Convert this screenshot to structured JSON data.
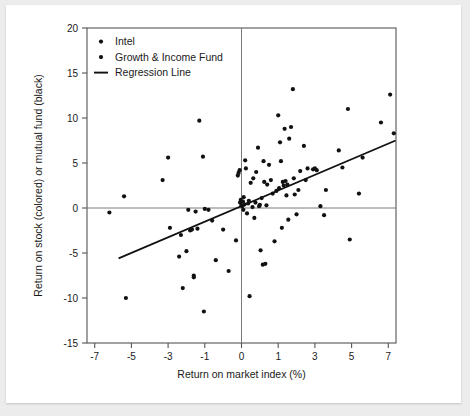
{
  "chart_data": {
    "type": "scatter",
    "title": "",
    "xlabel": "Return on market index (%)",
    "ylabel": "Return on stock (colored) or mutual fund (black)",
    "xlim": [
      -7.6,
      7.9
    ],
    "ylim": [
      -15,
      20
    ],
    "xticks": [
      "-7",
      "-5",
      "-3",
      "-1",
      "0",
      "1",
      "3",
      "5",
      "7"
    ],
    "xtick_values": [
      -7,
      -5,
      -3,
      -1,
      0,
      1,
      3,
      5,
      7
    ],
    "yticks": [
      "20",
      "15",
      "10",
      "5",
      "0",
      "-5",
      "-10",
      "-15"
    ],
    "ytick_values": [
      20,
      15,
      10,
      5,
      0,
      -5,
      -10,
      -15
    ],
    "grid": false,
    "reference_lines": [
      {
        "name": "zero-horizontal",
        "axis": "y",
        "value": 0,
        "color": "#7a7a7a"
      },
      {
        "name": "zero-vertical",
        "axis": "x",
        "value": 0,
        "color": "#7a7a7a"
      }
    ],
    "legend": {
      "position": "top-left",
      "entries": [
        {
          "label": "Intel",
          "marker": "dot",
          "color": "#111111"
        },
        {
          "label": "Growth & Income Fund",
          "marker": "dot",
          "color": "#111111"
        },
        {
          "label": "Regression Line",
          "marker": "line",
          "color": "#111111"
        }
      ]
    },
    "series": [
      {
        "name": "Growth & Income Fund",
        "marker": "dot",
        "color": "#111111",
        "points": [
          [
            -5.4,
            1.3
          ],
          [
            -5.3,
            -10.0
          ],
          [
            -6.2,
            -0.5
          ],
          [
            -3.3,
            3.1
          ],
          [
            -3.0,
            5.6
          ],
          [
            -2.9,
            -2.2
          ],
          [
            -2.4,
            -5.4
          ],
          [
            -2.3,
            -3.0
          ],
          [
            -2.2,
            -8.9
          ],
          [
            -2.0,
            -4.8
          ],
          [
            -1.9,
            -0.2
          ],
          [
            -1.8,
            -2.5
          ],
          [
            -1.7,
            -2.4
          ],
          [
            -1.6,
            -7.5
          ],
          [
            -1.6,
            -7.7
          ],
          [
            -1.5,
            -0.4
          ],
          [
            -1.4,
            -2.3
          ],
          [
            -1.3,
            9.7
          ],
          [
            -1.1,
            5.7
          ],
          [
            -1.05,
            -11.5
          ],
          [
            -1.0,
            -0.1
          ],
          [
            -0.9,
            -0.2
          ],
          [
            -0.8,
            -1.4
          ],
          [
            -0.7,
            -5.8
          ],
          [
            -0.5,
            -2.4
          ],
          [
            -0.35,
            -7.0
          ],
          [
            -0.15,
            -3.6
          ],
          [
            -0.1,
            3.6
          ],
          [
            -0.08,
            3.9
          ],
          [
            -0.05,
            4.2
          ],
          [
            -0.04,
            0.6
          ],
          [
            -0.02,
            0.9
          ],
          [
            0.0,
            0.3
          ],
          [
            0.02,
            0.2
          ],
          [
            0.04,
            0.7
          ],
          [
            0.05,
            -0.2
          ],
          [
            0.06,
            1.2
          ],
          [
            0.08,
            0.4
          ],
          [
            0.1,
            5.3
          ],
          [
            0.12,
            4.4
          ],
          [
            0.15,
            -0.6
          ],
          [
            0.18,
            0.5
          ],
          [
            0.2,
            0.8
          ],
          [
            0.22,
            -9.8
          ],
          [
            0.25,
            2.8
          ],
          [
            0.3,
            0.1
          ],
          [
            0.32,
            3.3
          ],
          [
            0.35,
            -1.1
          ],
          [
            0.38,
            0.6
          ],
          [
            0.4,
            4.0
          ],
          [
            0.45,
            6.7
          ],
          [
            0.48,
            0.2
          ],
          [
            0.5,
            0.35
          ],
          [
            0.52,
            -4.7
          ],
          [
            0.55,
            1.1
          ],
          [
            0.58,
            -6.3
          ],
          [
            0.6,
            5.2
          ],
          [
            0.62,
            2.9
          ],
          [
            0.65,
            -6.2
          ],
          [
            0.68,
            0.3
          ],
          [
            0.7,
            2.6
          ],
          [
            0.75,
            4.8
          ],
          [
            0.8,
            3.1
          ],
          [
            0.85,
            1.6
          ],
          [
            0.9,
            -3.7
          ],
          [
            0.95,
            1.9
          ],
          [
            1.0,
            10.3
          ],
          [
            1.05,
            2.2
          ],
          [
            1.1,
            7.3
          ],
          [
            1.15,
            5.2
          ],
          [
            1.2,
            -2.2
          ],
          [
            1.25,
            2.9
          ],
          [
            1.3,
            2.5
          ],
          [
            1.35,
            8.8
          ],
          [
            1.4,
            3.0
          ],
          [
            1.45,
            1.4
          ],
          [
            1.5,
            2.6
          ],
          [
            1.55,
            -1.3
          ],
          [
            1.6,
            7.7
          ],
          [
            1.7,
            9.0
          ],
          [
            1.8,
            13.2
          ],
          [
            1.85,
            3.3
          ],
          [
            1.9,
            1.5
          ],
          [
            2.0,
            -0.7
          ],
          [
            2.1,
            2.0
          ],
          [
            2.2,
            4.1
          ],
          [
            2.4,
            6.9
          ],
          [
            2.5,
            3.1
          ],
          [
            2.6,
            4.4
          ],
          [
            2.9,
            4.3
          ],
          [
            3.0,
            4.4
          ],
          [
            3.1,
            4.2
          ],
          [
            3.3,
            0.2
          ],
          [
            3.5,
            -0.8
          ],
          [
            3.6,
            2.0
          ],
          [
            4.3,
            6.4
          ],
          [
            4.5,
            4.5
          ],
          [
            4.8,
            11.0
          ],
          [
            4.9,
            -3.5
          ],
          [
            5.4,
            1.6
          ],
          [
            5.6,
            5.6
          ],
          [
            6.6,
            9.5
          ],
          [
            7.1,
            12.6
          ],
          [
            7.3,
            8.3
          ]
        ]
      }
    ],
    "regression_line": {
      "name": "Regression Line",
      "color": "#111111",
      "x_start": -5.7,
      "y_start": -5.6,
      "x_end": 7.4,
      "y_end": 7.5
    }
  }
}
